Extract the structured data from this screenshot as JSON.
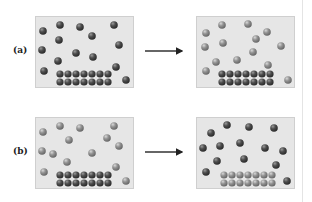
{
  "colors": {
    "dark_ball": "#4a4a4a",
    "dark_ball_hi": "#8a8a8a",
    "light_ball": "#8f8f8f",
    "light_ball_hi": "#cfcfcf",
    "box_fill": "#e6e6e6",
    "arrow": "#222222"
  },
  "rows": [
    {
      "label": "(a)",
      "description": "Dark gas particles exchange with dark solid lattice; afterwards free particles appear lighter (isotopic exchange).",
      "before": {
        "free_particles": "dark",
        "lattice": "dark"
      },
      "after": {
        "free_particles": "light",
        "lattice": "dark"
      }
    },
    {
      "label": "(b)",
      "description": "Light gas particles over dark lattice; afterwards gas particles are dark and lattice is light.",
      "before": {
        "free_particles": "light",
        "lattice": "dark"
      },
      "after": {
        "free_particles": "dark",
        "lattice": "light"
      }
    }
  ]
}
